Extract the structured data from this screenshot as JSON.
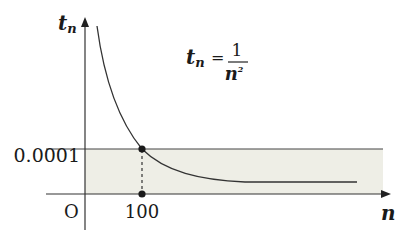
{
  "diagram": {
    "type": "function-graph",
    "y_axis_label_main": "t",
    "y_axis_label_sub": "n",
    "x_axis_label": "n",
    "origin_label": "O",
    "formula": {
      "lhs_main": "t",
      "lhs_sub": "n",
      "equals": "=",
      "numerator": "1",
      "denominator_base": "n",
      "denominator_exp": "2"
    },
    "threshold_label": "0.0001",
    "threshold_x_label": "100",
    "colors": {
      "line": "#333333",
      "shade": "#eeeee6",
      "point": "#1a1a1a"
    }
  }
}
